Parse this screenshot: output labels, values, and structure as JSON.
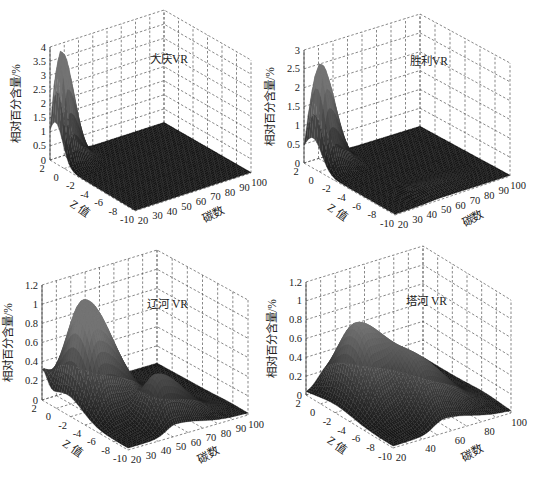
{
  "chart_data": [
    {
      "type": "surface3d",
      "title": "大庆VR",
      "xlabel": "碳数",
      "ylabel": "Z 值",
      "zlabel": "相对百分含量/%",
      "x_ticks": [
        "20",
        "30",
        "40",
        "50",
        "60",
        "70",
        "80",
        "90",
        "100"
      ],
      "x_range": [
        20,
        100
      ],
      "y_ticks": [
        "2",
        "0",
        "-2",
        "-4",
        "-6",
        "-8",
        "-10"
      ],
      "y_range": [
        2,
        -10
      ],
      "z_ticks": [
        "0",
        "0.5",
        "1",
        "1.5",
        "2",
        "2.5",
        "3",
        "3.5",
        "4"
      ],
      "z_range": [
        0,
        4
      ],
      "grid": true,
      "peaks": [
        {
          "x_center": 24,
          "y_center": 1.2,
          "height": 3.9,
          "x_width": 4,
          "y_width": 1.4,
          "note": "sharp peak at low carbon number, Z≈0~2"
        }
      ],
      "baseline": 0.02
    },
    {
      "type": "surface3d",
      "title": "胜利VR",
      "xlabel": "碳数",
      "ylabel": "Z 值",
      "zlabel": "相对百分含量/%",
      "x_ticks": [
        "20",
        "30",
        "40",
        "50",
        "60",
        "70",
        "80",
        "90",
        "100"
      ],
      "x_range": [
        20,
        100
      ],
      "y_ticks": [
        "2",
        "0",
        "-2",
        "-4",
        "-6",
        "-8",
        "-10"
      ],
      "y_range": [
        2,
        -10
      ],
      "z_ticks": [
        "0",
        "0.5",
        "1",
        "1.5",
        "2",
        "2.5",
        "3"
      ],
      "z_range": [
        0,
        3
      ],
      "grid": true,
      "peaks": [
        {
          "x_center": 25,
          "y_center": 0.8,
          "height": 2.7,
          "x_width": 4.5,
          "y_width": 1.6,
          "note": "sharp peak at low carbon number"
        },
        {
          "x_center": 50,
          "y_center": -8,
          "height": 0.15,
          "x_width": 10,
          "y_width": 1.5,
          "note": "small ripples near Z=-8"
        }
      ],
      "baseline": 0.02
    },
    {
      "type": "surface3d",
      "title": "辽河 VR",
      "xlabel": "碳数",
      "ylabel": "Z 值",
      "zlabel": "相对百分含量/%",
      "x_ticks": [
        "20",
        "30",
        "40",
        "50",
        "60",
        "70",
        "80",
        "90",
        "100"
      ],
      "x_range": [
        20,
        100
      ],
      "y_ticks": [
        "2",
        "0",
        "-2",
        "-4",
        "-6",
        "-8",
        "-10"
      ],
      "y_range": [
        2,
        -10
      ],
      "z_ticks": [
        "0",
        "0.2",
        "0.4",
        "0.6",
        "0.8",
        "1",
        "1.2"
      ],
      "z_range": [
        0,
        1.2
      ],
      "grid": true,
      "peaks": [
        {
          "x_center": 32,
          "y_center": -1.5,
          "height": 1.12,
          "x_width": 9,
          "y_width": 3.0,
          "note": "main broad peak"
        },
        {
          "x_center": 52,
          "y_center": -7.5,
          "height": 0.5,
          "x_width": 9,
          "y_width": 2.0,
          "note": "secondary peak at negative Z"
        },
        {
          "x_center": 20,
          "y_center": 2.0,
          "height": 0.25,
          "x_width": 2,
          "y_width": 1.0,
          "note": "small edge ridge"
        }
      ],
      "baseline": 0.02
    },
    {
      "type": "surface3d",
      "title": "塔河 VR",
      "xlabel": "碳数",
      "ylabel": "Z 值",
      "zlabel": "相对百分含量/%",
      "x_ticks": [
        "20",
        "40",
        "60",
        "80",
        "100"
      ],
      "x_range": [
        20,
        100
      ],
      "y_ticks": [
        "2",
        "0",
        "-2",
        "-4",
        "-6",
        "-8",
        "-10"
      ],
      "y_range": [
        2,
        -10
      ],
      "z_ticks": [
        "0",
        "0.2",
        "0.4",
        "0.6",
        "0.8",
        "1",
        "1.2"
      ],
      "z_range": [
        0,
        1.2
      ],
      "grid": true,
      "peaks": [
        {
          "x_center": 36,
          "y_center": -2.0,
          "height": 0.85,
          "x_width": 10,
          "y_width": 3.5,
          "note": "main broad peak"
        },
        {
          "x_center": 55,
          "y_center": -6.5,
          "height": 0.5,
          "x_width": 10,
          "y_width": 3.0,
          "note": "secondary peak"
        }
      ],
      "baseline": 0.02
    }
  ],
  "layout": {
    "panels": [
      {
        "left": [
          50,
          47
        ],
        "back": [
          164,
          10
        ],
        "right": [
          251,
          60
        ],
        "front_bottom": [
          135,
          211
        ],
        "box_h": 113,
        "title_pos": [
          150,
          63
        ]
      },
      {
        "left": [
          304,
          50
        ],
        "back": [
          420,
          14
        ],
        "right": [
          510,
          63
        ],
        "front_bottom": [
          395,
          215
        ],
        "box_h": 113,
        "title_pos": [
          410,
          65
        ]
      },
      {
        "left": [
          42,
          285
        ],
        "back": [
          157,
          250
        ],
        "right": [
          248,
          300
        ],
        "front_bottom": [
          128,
          450
        ],
        "box_h": 115,
        "title_pos": [
          147,
          308
        ]
      },
      {
        "left": [
          306,
          282
        ],
        "back": [
          423,
          246
        ],
        "right": [
          511,
          300
        ],
        "front_bottom": [
          393,
          448
        ],
        "box_h": 113,
        "title_pos": [
          406,
          305
        ]
      }
    ]
  }
}
